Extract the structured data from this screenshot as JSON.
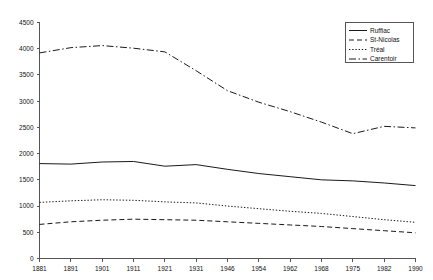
{
  "chart_data": {
    "type": "line",
    "title": "",
    "xlabel": "",
    "ylabel": "",
    "grid": false,
    "legend_position": "top-right",
    "xlim": [
      1881,
      1990
    ],
    "ylim": [
      0,
      4500
    ],
    "ytick_step": 500,
    "categories": [
      "1881",
      "1891",
      "1901",
      "1911",
      "1921",
      "1931",
      "1946",
      "1954",
      "1962",
      "1968",
      "1975",
      "1982",
      "1990"
    ],
    "x": [
      1881,
      1891,
      1901,
      1911,
      1921,
      1931,
      1946,
      1954,
      1962,
      1968,
      1975,
      1982,
      1990
    ],
    "yticks": [
      "0",
      "500",
      "1000",
      "1500",
      "2000",
      "2500",
      "3000",
      "3500",
      "4000",
      "4500"
    ],
    "ytick_values": [
      0,
      500,
      1000,
      1500,
      2000,
      2500,
      3000,
      3500,
      4000,
      4500
    ],
    "series": [
      {
        "name": "Ruffiac",
        "style": "solid",
        "dasharray": "",
        "values": [
          1810,
          1800,
          1840,
          1850,
          1760,
          1790,
          1700,
          1620,
          1560,
          1500,
          1480,
          1440,
          1390
        ]
      },
      {
        "name": "St-Nicolas",
        "style": "dashed",
        "dasharray": "5,3",
        "values": [
          650,
          700,
          730,
          750,
          740,
          730,
          700,
          670,
          640,
          610,
          570,
          530,
          490
        ]
      },
      {
        "name": "Tréal",
        "style": "dotted",
        "dasharray": "1.4,1.8",
        "values": [
          1070,
          1100,
          1120,
          1110,
          1080,
          1060,
          1000,
          950,
          900,
          860,
          800,
          740,
          690
        ]
      },
      {
        "name": "Carentoir",
        "style": "dash-dot",
        "dasharray": "7,2.5,1.5,2.5",
        "values": [
          3920,
          4020,
          4060,
          4010,
          3940,
          3580,
          3200,
          2980,
          2800,
          2600,
          2380,
          2520,
          2490
        ]
      }
    ]
  },
  "legend": {
    "items": [
      {
        "label": "Ruffiac"
      },
      {
        "label": "St-Nicolas"
      },
      {
        "label": "Tréal"
      },
      {
        "label": "Carentoir"
      }
    ]
  }
}
